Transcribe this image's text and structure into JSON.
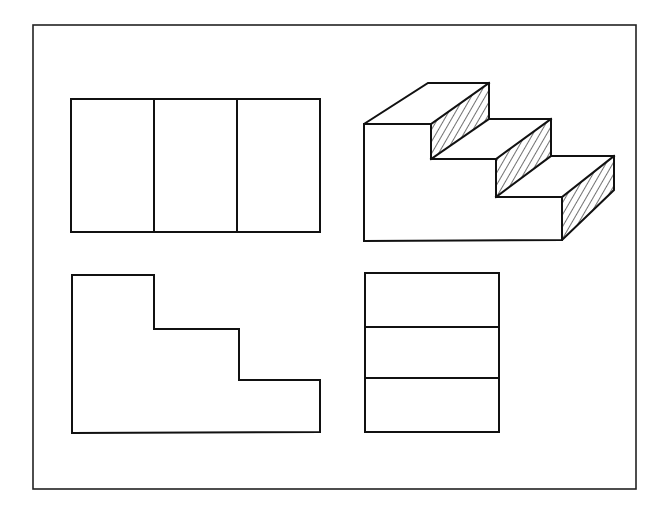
{
  "drawing": {
    "description": "Orthographic projection of a three-step stair block with isometric pictorial view",
    "colors": {
      "line": "#111111",
      "background": "#ffffff"
    },
    "views": [
      {
        "name": "top-view",
        "position": "top-left",
        "divisions": 3,
        "orientation": "vertical"
      },
      {
        "name": "isometric-view",
        "position": "top-right",
        "steps": 3,
        "risers_hatched": true
      },
      {
        "name": "front-view",
        "position": "bottom-left",
        "shape": "stepped L profile",
        "steps": 3
      },
      {
        "name": "side-view",
        "position": "bottom-right",
        "divisions": 3,
        "orientation": "horizontal"
      }
    ]
  }
}
